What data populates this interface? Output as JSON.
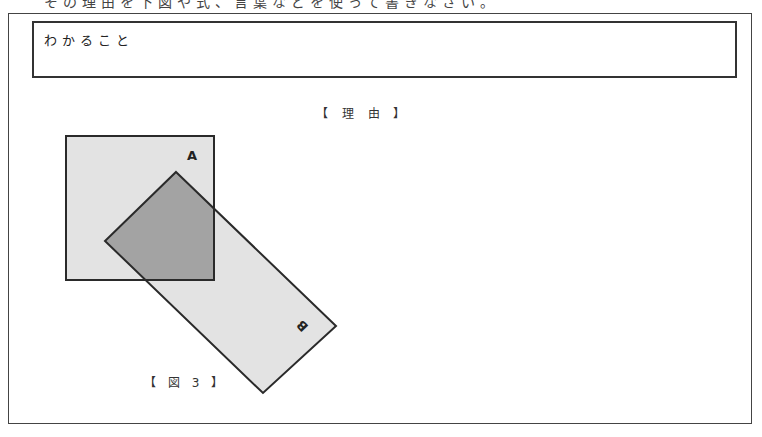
{
  "page": {
    "cropped_instruction": "その理由を下図や式、言葉などを使って書きなさい。"
  },
  "answer_box": {
    "label": "わかること"
  },
  "reason_section": {
    "title": "【 理 由 】"
  },
  "figure": {
    "caption": "【 図 3 】",
    "shapes": {
      "square_a": {
        "label": "A",
        "fill": "#e3e3e3",
        "stroke": "#2a2a2a"
      },
      "rect_b": {
        "label": "B",
        "fill": "#e3e3e3",
        "stroke": "#2a2a2a"
      },
      "overlap": {
        "fill": "#a3a3a3"
      }
    }
  }
}
